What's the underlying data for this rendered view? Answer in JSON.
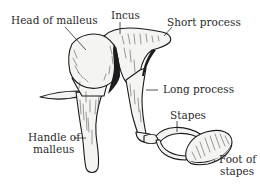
{
  "diagram": {
    "labels": {
      "head_of_malleus": "Head of malleus",
      "incus": "Incus",
      "short_process": "Short process",
      "long_process": "Long process",
      "stapes": "Stapes",
      "handle_of_malleus_line1": "Handle of",
      "handle_of_malleus_line2": "malleus",
      "foot_of_stapes_line1": "Foot of",
      "foot_of_stapes_line2": "stapes"
    },
    "colors": {
      "ink": "#1a1a1a",
      "text": "#2a2a2a",
      "bone_fill": "#f4f4f2",
      "background": "#ffffff"
    }
  }
}
